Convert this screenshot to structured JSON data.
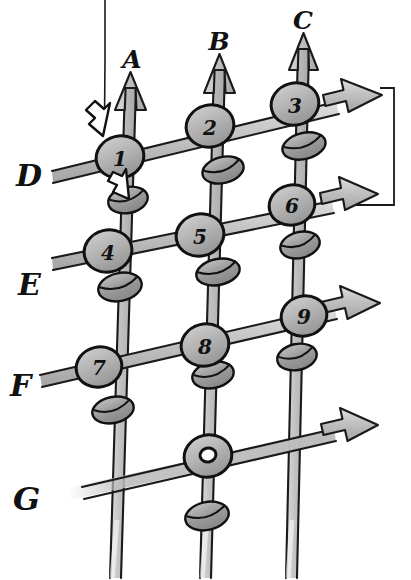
{
  "diagram": {
    "style": "hand-drawn sketch, grayscale",
    "background_color": "#ffffff",
    "ink_color": "#111111",
    "rail_fill": "#b3b3b3",
    "rail_fill_light": "#cfcfcf",
    "bead_fill": "#9d9d9d",
    "node_fill": "#b8b8b8",
    "white_arrow_fill": "#ffffff"
  },
  "vertical_rails": [
    {
      "id": "A",
      "label": "A",
      "label_x": 132,
      "label_y": 65,
      "x_top": 130,
      "y_top": 72,
      "x_bottom": 113,
      "y_bottom": 578,
      "has_arrowhead": true
    },
    {
      "id": "B",
      "label": "B",
      "label_x": 219,
      "label_y": 47,
      "x_top": 219,
      "y_top": 54,
      "x_bottom": 203,
      "y_bottom": 578,
      "has_arrowhead": true
    },
    {
      "id": "C",
      "label": "C",
      "label_x": 303,
      "label_y": 26,
      "x_top": 303,
      "y_top": 33,
      "x_bottom": 289,
      "y_bottom": 578,
      "has_arrowhead": true
    }
  ],
  "horizontal_rails": [
    {
      "id": "D",
      "label": "D",
      "label_x": 27,
      "label_y": 180,
      "x_start": 52,
      "y_start": 176,
      "x_end": 382,
      "y_end": 95,
      "has_arrowhead": true
    },
    {
      "id": "E",
      "label": "E",
      "label_x": 27,
      "label_y": 288,
      "x_start": 52,
      "y_start": 262,
      "x_end": 378,
      "y_end": 194,
      "has_arrowhead": true
    },
    {
      "id": "F",
      "label": "F",
      "label_x": 20,
      "label_y": 388,
      "x_start": 40,
      "y_start": 380,
      "x_end": 380,
      "y_end": 303,
      "has_arrowhead": true
    },
    {
      "id": "G",
      "label": "G",
      "label_x": 25,
      "label_y": 502,
      "x_start": 68,
      "y_start": 492,
      "x_end": 378,
      "y_end": 425,
      "has_arrowhead": true
    }
  ],
  "nodes": [
    {
      "id": "n1",
      "label": "1",
      "rail_h": "D",
      "rail_v": "A",
      "cx": 120,
      "cy": 157
    },
    {
      "id": "n2",
      "label": "2",
      "rail_h": "D",
      "rail_v": "B",
      "cx": 210,
      "cy": 126
    },
    {
      "id": "n3",
      "label": "3",
      "rail_h": "D",
      "rail_v": "C",
      "cx": 295,
      "cy": 104
    },
    {
      "id": "n4",
      "label": "4",
      "rail_h": "E",
      "rail_v": "A",
      "cx": 108,
      "cy": 251
    },
    {
      "id": "n5",
      "label": "5",
      "rail_h": "E",
      "rail_v": "B",
      "cx": 200,
      "cy": 235
    },
    {
      "id": "n6",
      "label": "6",
      "rail_h": "E",
      "rail_v": "C",
      "cx": 292,
      "cy": 205
    },
    {
      "id": "n7",
      "label": "7",
      "rail_h": "F",
      "rail_v": "A",
      "cx": 99,
      "cy": 367
    },
    {
      "id": "n8",
      "label": "8",
      "rail_h": "F",
      "rail_v": "B",
      "cx": 205,
      "cy": 345
    },
    {
      "id": "n9",
      "label": "9",
      "rail_h": "F",
      "rail_v": "C",
      "cx": 304,
      "cy": 316
    },
    {
      "id": "n0",
      "label": "0",
      "rail_h": "G",
      "rail_v": "B",
      "cx": 208,
      "cy": 456
    }
  ],
  "beads": [
    {
      "id": "b-a-1",
      "rail_v": "A",
      "cx": 128,
      "cy": 200
    },
    {
      "id": "b-a-2",
      "rail_v": "A",
      "cx": 120,
      "cy": 287
    },
    {
      "id": "b-a-3",
      "rail_v": "A",
      "cx": 113,
      "cy": 410
    },
    {
      "id": "b-b-1",
      "rail_v": "B",
      "cx": 223,
      "cy": 170
    },
    {
      "id": "b-b-2",
      "rail_v": "B",
      "cx": 218,
      "cy": 272
    },
    {
      "id": "b-b-3",
      "rail_v": "B",
      "cx": 213,
      "cy": 375
    },
    {
      "id": "b-b-4",
      "rail_v": "B",
      "cx": 207,
      "cy": 516
    },
    {
      "id": "b-c-1",
      "rail_v": "C",
      "cx": 304,
      "cy": 146
    },
    {
      "id": "b-c-2",
      "rail_v": "C",
      "cx": 300,
      "cy": 245
    },
    {
      "id": "b-c-3",
      "rail_v": "C",
      "cx": 297,
      "cy": 357
    }
  ],
  "callout_arrows": [
    {
      "id": "arrow-to-node1",
      "points_to": "n1",
      "tip_x": 102,
      "tip_y": 135,
      "angle": 55
    },
    {
      "id": "arrow-to-bead-a1",
      "points_to": "b-a-1",
      "tip_x": 127,
      "tip_y": 196,
      "angle": 70
    }
  ],
  "leader_lines": [
    {
      "id": "top-left-leader",
      "x1": 105,
      "y1": 0,
      "x2": 105,
      "y2": 120,
      "description": "thin vertical line from top edge down to the white callout arrow"
    },
    {
      "id": "right-bracket",
      "description": "thin bracket joining D arrow tip and E arrow tip",
      "x_right": 393,
      "y_top": 88,
      "y_bottom": 206,
      "x_left_top": 378,
      "x_left_bottom": 350
    }
  ]
}
